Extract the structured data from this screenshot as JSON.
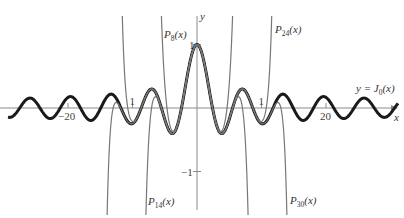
{
  "chart_data": {
    "type": "line",
    "title": "",
    "xlabel": "x",
    "ylabel": "y",
    "xlim": [
      -29,
      31
    ],
    "ylim": [
      -1.7,
      1.7
    ],
    "grid": false,
    "x_ticks": [
      {
        "value": -20,
        "label": "−20"
      },
      {
        "value": 20,
        "label": "20"
      },
      {
        "value": -10,
        "label": "1"
      },
      {
        "value": 10,
        "label": "1"
      }
    ],
    "y_ticks": [
      {
        "value": 1,
        "label": "1"
      },
      {
        "value": -1,
        "label": "−1"
      }
    ],
    "series": [
      {
        "name": "y = J0(x)",
        "function": "bessel_j0",
        "style": "thick",
        "color": "#1a1a1a",
        "label": "y = J",
        "label_sub": "0",
        "label_tail": "(x)",
        "label_pos": [
          356,
          92
        ]
      },
      {
        "name": "P8(x)",
        "function": "taylor_j0",
        "degree": 8,
        "style": "thin",
        "color": "#777777",
        "label": "P",
        "label_sub": "8",
        "label_tail": "(x)",
        "label_pos": [
          164,
          38
        ]
      },
      {
        "name": "P14(x)",
        "function": "taylor_j0",
        "degree": 14,
        "style": "thin",
        "color": "#777777",
        "label": "P",
        "label_sub": "14",
        "label_tail": "(x)",
        "label_pos": [
          148,
          205
        ]
      },
      {
        "name": "P24(x)",
        "function": "taylor_j0",
        "degree": 24,
        "style": "thin",
        "color": "#777777",
        "label": "P",
        "label_sub": "24",
        "label_tail": "(x)",
        "label_pos": [
          275,
          33
        ]
      },
      {
        "name": "P30(x)",
        "function": "taylor_j0",
        "degree": 30,
        "style": "thin",
        "color": "#777777",
        "label": "P",
        "label_sub": "30",
        "label_tail": "(x)",
        "label_pos": [
          290,
          204
        ]
      }
    ],
    "annotations": [
      "y = J0(x)",
      "P8(x)",
      "P14(x)",
      "P24(x)",
      "P30(x)"
    ]
  },
  "axes": {
    "x_label": "x",
    "y_label": "y",
    "origin_px": [
      197,
      108
    ],
    "x_scale_px_per_unit": 6.45,
    "y_scale_px_per_unit": 63.5,
    "axis_color": "#8a8a8a"
  }
}
